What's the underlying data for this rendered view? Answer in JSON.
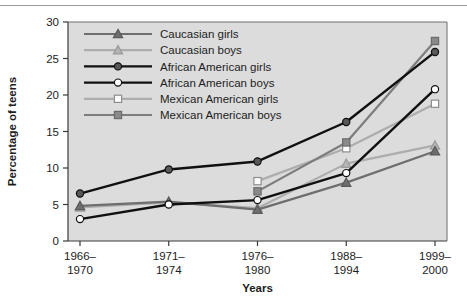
{
  "chart_data": {
    "type": "line",
    "title": "",
    "xlabel": "Years",
    "ylabel": "Percentage of teens",
    "categories": [
      "1966–\n1970",
      "1971–\n1974",
      "1976–\n1980",
      "1988–\n1994",
      "1999–\n2000"
    ],
    "category_lines": [
      [
        "1966–",
        "1970"
      ],
      [
        "1971–",
        "1974"
      ],
      [
        "1976–",
        "1980"
      ],
      [
        "1988–",
        "1994"
      ],
      [
        "1999–",
        "2000"
      ]
    ],
    "ylim": [
      0,
      30
    ],
    "yticks": [
      0,
      5,
      10,
      15,
      20,
      25,
      30
    ],
    "ytick_labels": [
      "0",
      "5",
      "10",
      "15",
      "20",
      "25",
      "30"
    ],
    "grid": false,
    "legend_position": "top-left-inside",
    "plot_background": "#dcdcdc",
    "series": [
      {
        "name": "Caucasian girls",
        "marker": "triangle",
        "color": "#6e6e6e",
        "marker_fill": "#6e6e6e",
        "marker_stroke": "#5a5a5a",
        "values": [
          4.8,
          5.4,
          4.3,
          8.0,
          12.3
        ]
      },
      {
        "name": "Caucasian boys",
        "marker": "triangle",
        "color": "#adadad",
        "marker_fill": "#b4b4b4",
        "marker_stroke": "#9a9a9a",
        "values": [
          4.6,
          5.3,
          4.5,
          10.6,
          13.1
        ]
      },
      {
        "name": "African American girls",
        "marker": "circle",
        "color": "#101010",
        "marker_fill": "#585858",
        "marker_stroke": "#101010",
        "values": [
          6.5,
          9.8,
          10.9,
          16.3,
          25.9
        ]
      },
      {
        "name": "African American boys",
        "marker": "circle",
        "color": "#101010",
        "marker_fill": "#ffffff",
        "marker_stroke": "#101010",
        "values": [
          3.0,
          5.0,
          5.6,
          9.3,
          20.8
        ]
      },
      {
        "name": "Mexican American girls",
        "marker": "square",
        "color": "#adadad",
        "marker_fill": "#ffffff",
        "marker_stroke": "#8e8e8e",
        "values": [
          null,
          null,
          8.2,
          12.7,
          18.8
        ]
      },
      {
        "name": "Mexican American boys",
        "marker": "square",
        "color": "#7d7d7d",
        "marker_fill": "#8a8a8a",
        "marker_stroke": "#6a6a6a",
        "values": [
          null,
          null,
          6.8,
          13.5,
          27.4
        ]
      }
    ]
  }
}
